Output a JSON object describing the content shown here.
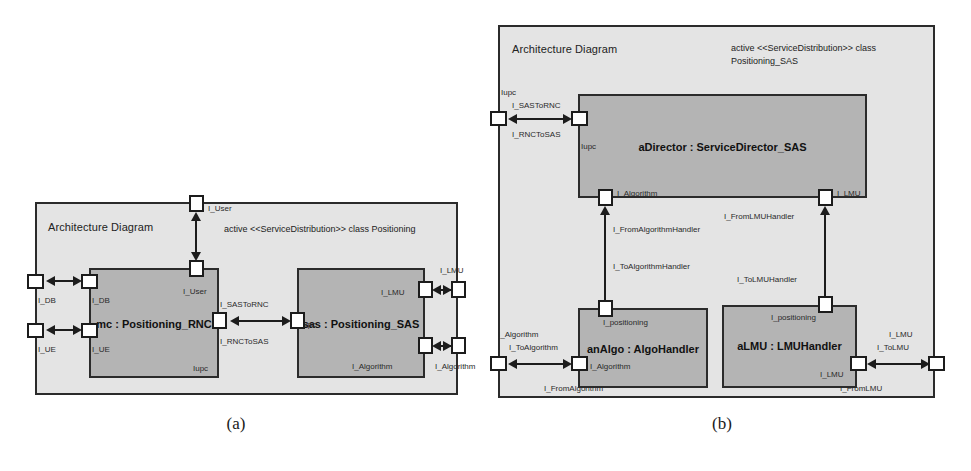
{
  "figure": {
    "captions": [
      {
        "id": "a",
        "text": "(a)"
      },
      {
        "id": "b",
        "text": "(b)"
      }
    ]
  },
  "diagram_a": {
    "frame_title": "Architecture Diagram",
    "stereotype": "active <<ServiceDistribution>> class Positioning",
    "classes": [
      {
        "id": "mc",
        "name": "mc : Positioning_RNC",
        "iupc_label": "Iupc"
      },
      {
        "id": "sas",
        "name": "sas : Positioning_SAS",
        "iupc_label": "Iupc"
      }
    ],
    "labels": {
      "user_outer": "I_User",
      "user_inner": "I_User",
      "db_outer": "I_DB",
      "db_inner": "I_DB",
      "ue_outer": "I_UE",
      "ue_inner": "I_UE",
      "sas_to_rnc": "I_SASToRNC",
      "rnc_to_sas": "I_RNCToSAS",
      "lmu_inner": "I_LMU",
      "lmu_outer": "I_LMU",
      "algorithm_inner": "I_Algorithm",
      "algorithm_outer": "I_Algorithm"
    }
  },
  "diagram_b": {
    "frame_title": "Architecture Diagram",
    "stereotype_line1": "active <<ServiceDistribution>> class",
    "stereotype_line2": "Positioning_SAS",
    "classes": [
      {
        "id": "aDirector",
        "name": "aDirector : ServiceDirector_SAS"
      },
      {
        "id": "anAlgo",
        "name": "anAlgo : AlgoHandler"
      },
      {
        "id": "aLMU",
        "name": "aLMU : LMUHandler"
      }
    ],
    "labels": {
      "iupc_outer": "Iupc",
      "iupc_inner": "Iupc",
      "sas_to_rnc": "I_SASToRNC",
      "rnc_to_sas": "I_RNCToSAS",
      "director_algorithm": "I_Algorithm",
      "director_lmu": "I_LMU",
      "from_algorithm_handler": "I_FromAlgorithmHandler",
      "to_algorithm_handler": "I_ToAlgorithmHandler",
      "from_lmu_handler": "I_FromLMUHandler",
      "to_lmu_handler": "I_ToLMUHandler",
      "algo_positioning": "I_positioning",
      "lmu_positioning": "I_positioning",
      "algo_algorithm": "I_Algorithm",
      "algorithm_outer": "I_Algorithm",
      "to_algorithm": "I_ToAlgorithm",
      "from_algorithm": "I_FromAlgorithm",
      "lmu_lmu": "I_LMU",
      "lmu_outer": "I_LMU",
      "to_lmu": "I_ToLMU",
      "from_lmu": "I_FromLMU"
    }
  },
  "colors": {
    "frame_fill": "#e4e4e4",
    "class_fill": "#b4b4b4",
    "stroke": "#2b2b2b",
    "port_fill": "#ffffff"
  }
}
